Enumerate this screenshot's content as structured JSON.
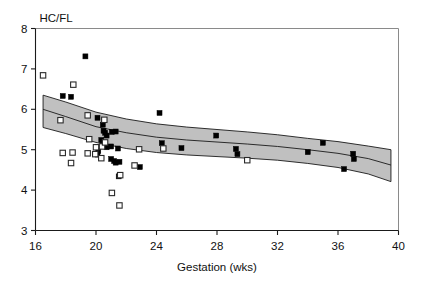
{
  "chart_data": {
    "type": "scatter",
    "title": "",
    "xlabel": "Gestation (wks)",
    "ylabel": "HC/FL",
    "xlim": [
      16,
      40
    ],
    "ylim": [
      3,
      8
    ],
    "xticks": [
      16,
      20,
      24,
      28,
      32,
      36,
      40
    ],
    "yticks": [
      3,
      4,
      5,
      6,
      7,
      8
    ],
    "xtick_labels": [
      "16",
      "20",
      "24",
      "28",
      "32",
      "36",
      "40"
    ],
    "ytick_labels": [
      "3",
      "4",
      "5",
      "6",
      "7",
      "8"
    ],
    "grid": false,
    "legend": "none",
    "series": [
      {
        "name": "filled-squares",
        "marker": "filled-square",
        "color": "#000000",
        "points": [
          [
            19.3,
            7.31
          ],
          [
            17.8,
            6.33
          ],
          [
            18.35,
            6.31
          ],
          [
            20.1,
            5.79
          ],
          [
            20.45,
            5.62
          ],
          [
            20.5,
            5.47
          ],
          [
            20.6,
            5.42
          ],
          [
            20.7,
            5.35
          ],
          [
            21.05,
            5.44
          ],
          [
            21.3,
            5.45
          ],
          [
            20.35,
            5.24
          ],
          [
            20.45,
            5.16
          ],
          [
            20.55,
            5.1
          ],
          [
            20.7,
            5.06
          ],
          [
            21.0,
            5.08
          ],
          [
            21.45,
            5.03
          ],
          [
            20.15,
            4.97
          ],
          [
            20.1,
            4.88
          ],
          [
            21.2,
            4.72
          ],
          [
            21.3,
            4.68
          ],
          [
            21.55,
            4.7
          ],
          [
            21.0,
            4.77
          ],
          [
            21.5,
            4.34
          ],
          [
            22.9,
            4.57
          ],
          [
            24.2,
            5.91
          ],
          [
            24.35,
            5.16
          ],
          [
            25.65,
            5.04
          ],
          [
            27.95,
            5.35
          ],
          [
            29.25,
            5.02
          ],
          [
            29.35,
            4.89
          ],
          [
            34.0,
            4.94
          ],
          [
            35.0,
            5.17
          ],
          [
            36.4,
            4.52
          ],
          [
            37.0,
            4.9
          ],
          [
            37.05,
            4.77
          ]
        ]
      },
      {
        "name": "open-squares",
        "marker": "open-square",
        "color": "#ffffff",
        "points": [
          [
            16.5,
            6.84
          ],
          [
            18.5,
            6.61
          ],
          [
            17.65,
            5.73
          ],
          [
            19.45,
            5.85
          ],
          [
            20.55,
            5.74
          ],
          [
            19.55,
            5.26
          ],
          [
            20.0,
            5.06
          ],
          [
            20.4,
            5.08
          ],
          [
            20.6,
            5.18
          ],
          [
            22.85,
            5.01
          ],
          [
            24.45,
            5.03
          ],
          [
            17.8,
            4.92
          ],
          [
            18.45,
            4.93
          ],
          [
            19.45,
            4.91
          ],
          [
            19.95,
            4.89
          ],
          [
            20.35,
            4.79
          ],
          [
            18.35,
            4.67
          ],
          [
            22.55,
            4.61
          ],
          [
            21.6,
            4.37
          ],
          [
            30.0,
            4.74
          ],
          [
            21.05,
            3.93
          ],
          [
            21.55,
            3.62
          ]
        ]
      }
    ],
    "reference_band": {
      "name": "normal-range-band",
      "fill_color": "#c0c0c0",
      "x": [
        16.5,
        18.0,
        20.0,
        22.0,
        24.0,
        26.0,
        28.0,
        30.0,
        32.0,
        34.0,
        36.0,
        38.0,
        39.5
      ],
      "upper": [
        6.35,
        6.18,
        5.93,
        5.76,
        5.64,
        5.56,
        5.5,
        5.44,
        5.37,
        5.28,
        5.2,
        5.09,
        5.0
      ],
      "lower": [
        5.55,
        5.4,
        5.18,
        5.03,
        4.93,
        4.87,
        4.83,
        4.79,
        4.74,
        4.66,
        4.56,
        4.4,
        4.21
      ],
      "center": [
        6.0,
        5.82,
        5.57,
        5.42,
        5.31,
        5.24,
        5.19,
        5.14,
        5.08,
        5.0,
        4.91,
        4.78,
        4.62
      ]
    }
  }
}
